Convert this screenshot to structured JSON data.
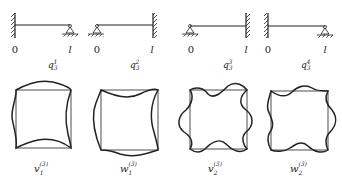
{
  "beams": [
    {
      "left_support": "clamped",
      "right_support": "pinned",
      "left_label": "0",
      "right_label": "l",
      "caption_base": "q",
      "caption_sub": "3",
      "caption_sup": "1"
    },
    {
      "left_support": "pinned",
      "right_support": "clamped",
      "left_label": "0",
      "right_label": "l",
      "caption_base": "q",
      "caption_sub": "3",
      "caption_sup": "2"
    },
    {
      "left_support": "pinned",
      "right_support": "clamped",
      "left_label": "0",
      "right_label": "l",
      "caption_base": "q",
      "caption_sub": "3",
      "caption_sup": "3"
    },
    {
      "left_support": "clamped",
      "right_support": "pinned",
      "left_label": "0",
      "right_label": "l",
      "caption_base": "q",
      "caption_sub": "3",
      "caption_sup": "4"
    }
  ],
  "modes": [
    {
      "caption_base": "v",
      "caption_sub": "1",
      "caption_sup": "(3)"
    },
    {
      "caption_base": "w",
      "caption_sub": "1",
      "caption_sup": "(3)"
    },
    {
      "caption_base": "v",
      "caption_sub": "2",
      "caption_sup": "(3)"
    },
    {
      "caption_base": "w",
      "caption_sub": "2",
      "caption_sup": "(3)"
    }
  ]
}
